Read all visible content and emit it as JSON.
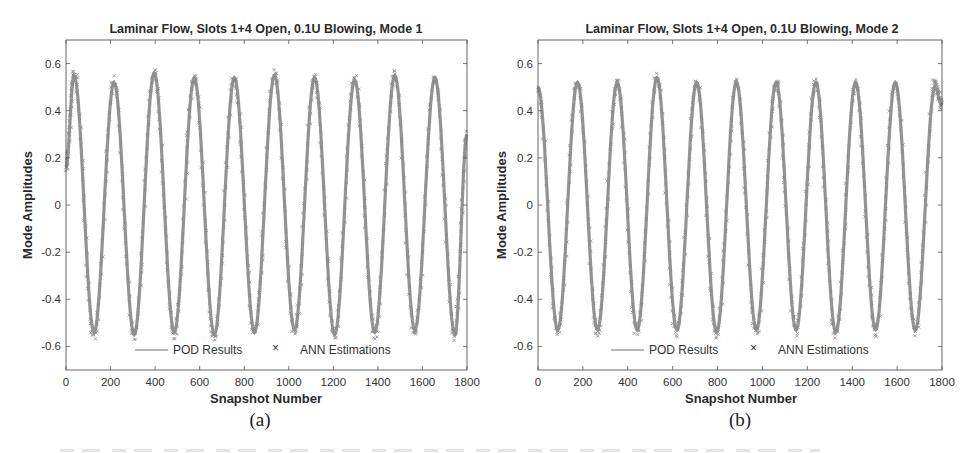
{
  "figure": {
    "panels": [
      {
        "id": "a",
        "sublabel": "(a)",
        "title": "Laminar Flow, Slots 1+4 Open, 0.1U Blowing, Mode 1",
        "xlabel": "Snapshot Number",
        "ylabel": "Mode Amplitudes",
        "legend": {
          "line_label": "POD Results",
          "marker_label": "ANN Estimations"
        }
      },
      {
        "id": "b",
        "sublabel": "(b)",
        "title": "Laminar Flow, Slots 1+4 Open, 0.1U Blowing, Mode 2",
        "xlabel": "Snapshot Number",
        "ylabel": "Mode Amplitudes",
        "legend": {
          "line_label": "POD Results",
          "marker_label": "ANN Estimations"
        }
      }
    ],
    "colors": {
      "series": "#6f6f6f",
      "marker": "#8a8a8a",
      "axis": "#555555",
      "text": "#2a2a2a"
    }
  },
  "chart_data": [
    {
      "type": "line",
      "title": "Laminar Flow, Slots 1+4 Open, 0.1U Blowing, Mode 1",
      "xlabel": "Snapshot Number",
      "ylabel": "Mode Amplitudes",
      "xlim": [
        0,
        1800
      ],
      "ylim": [
        -0.7,
        0.7
      ],
      "xticks": [
        0,
        200,
        400,
        600,
        800,
        1000,
        1200,
        1400,
        1600,
        1800
      ],
      "yticks": [
        -0.6,
        -0.4,
        -0.2,
        0,
        0.2,
        0.4,
        0.6
      ],
      "ytick_labels": [
        "-0.6",
        "-0.4",
        "-0.2",
        "0",
        "0.2",
        "0.4",
        "0.6"
      ],
      "grid": false,
      "legend_position": "lower center (inside)",
      "model": {
        "amplitude": 0.53,
        "period": 180,
        "phase_peak_at": 36
      },
      "series": [
        {
          "name": "POD Results",
          "style": "line",
          "x": [
            0,
            36,
            126,
            216,
            306,
            396,
            486,
            576,
            666,
            756,
            846,
            936,
            1026,
            1116,
            1206,
            1296,
            1386,
            1476,
            1566,
            1656,
            1746,
            1800
          ],
          "y": [
            0.16,
            0.55,
            -0.54,
            0.52,
            -0.55,
            0.56,
            -0.54,
            0.54,
            -0.55,
            0.54,
            -0.54,
            0.55,
            -0.53,
            0.54,
            -0.55,
            0.53,
            -0.54,
            0.55,
            -0.53,
            0.54,
            -0.55,
            0.3
          ]
        },
        {
          "name": "ANN Estimations",
          "style": "x-markers",
          "x": [
            0,
            36,
            126,
            216,
            306,
            396,
            486,
            576,
            666,
            756,
            846,
            936,
            1026,
            1116,
            1206,
            1296,
            1386,
            1476,
            1566,
            1656,
            1746,
            1800
          ],
          "y": [
            0.16,
            0.56,
            -0.55,
            0.53,
            -0.56,
            0.56,
            -0.55,
            0.54,
            -0.56,
            0.54,
            -0.55,
            0.56,
            -0.54,
            0.54,
            -0.56,
            0.54,
            -0.55,
            0.56,
            -0.54,
            0.54,
            -0.56,
            0.3
          ]
        }
      ]
    },
    {
      "type": "line",
      "title": "Laminar Flow, Slots 1+4 Open, 0.1U Blowing, Mode 2",
      "xlabel": "Snapshot Number",
      "ylabel": "Mode Amplitudes",
      "xlim": [
        0,
        1800
      ],
      "ylim": [
        -0.7,
        0.7
      ],
      "xticks": [
        0,
        200,
        400,
        600,
        800,
        1000,
        1200,
        1400,
        1600,
        1800
      ],
      "yticks": [
        -0.6,
        -0.4,
        -0.2,
        0,
        0.2,
        0.4,
        0.6
      ],
      "ytick_labels": [
        "-0.6",
        "-0.4",
        "-0.2",
        "0",
        "0.2",
        "0.4",
        "0.6"
      ],
      "grid": false,
      "legend_position": "lower center (inside)",
      "model": {
        "amplitude": 0.52,
        "period": 177,
        "phase_peak_at": 176
      },
      "series": [
        {
          "name": "POD Results",
          "style": "line",
          "x": [
            0,
            88,
            176,
            265,
            353,
            442,
            530,
            619,
            707,
            796,
            884,
            973,
            1061,
            1150,
            1238,
            1327,
            1415,
            1504,
            1592,
            1681,
            1769,
            1800
          ],
          "y": [
            0.5,
            -0.53,
            0.52,
            -0.53,
            0.52,
            -0.53,
            0.54,
            -0.53,
            0.52,
            -0.54,
            0.52,
            -0.53,
            0.52,
            -0.53,
            0.52,
            -0.54,
            0.52,
            -0.53,
            0.52,
            -0.53,
            0.5,
            0.42
          ]
        },
        {
          "name": "ANN Estimations",
          "style": "x-markers",
          "x": [
            0,
            88,
            176,
            265,
            353,
            442,
            530,
            619,
            707,
            796,
            884,
            973,
            1061,
            1150,
            1238,
            1327,
            1415,
            1504,
            1592,
            1681,
            1769,
            1800
          ],
          "y": [
            0.5,
            -0.54,
            0.52,
            -0.54,
            0.52,
            -0.54,
            0.55,
            -0.54,
            0.52,
            -0.55,
            0.52,
            -0.54,
            0.52,
            -0.54,
            0.52,
            -0.55,
            0.52,
            -0.54,
            0.52,
            -0.54,
            0.52,
            0.42
          ]
        }
      ]
    }
  ]
}
